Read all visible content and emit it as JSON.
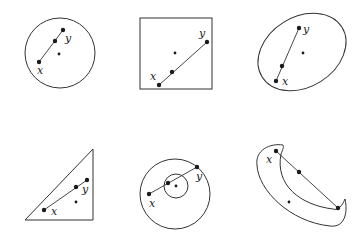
{
  "figure": {
    "panels": [
      {
        "shape": "circle",
        "labels": {
          "x": "x",
          "y": "y"
        },
        "convex": true
      },
      {
        "shape": "square",
        "labels": {
          "x": "x",
          "y": "y"
        },
        "convex": true
      },
      {
        "shape": "ellipse",
        "labels": {
          "x": "x",
          "y": "y"
        },
        "convex": true
      },
      {
        "shape": "triangle",
        "labels": {
          "x": "x",
          "y": "y"
        },
        "convex": true
      },
      {
        "shape": "annulus",
        "labels": {
          "x": "x",
          "y": "y"
        },
        "convex": false
      },
      {
        "shape": "crescent",
        "labels": {
          "x": "x"
        },
        "convex": false
      }
    ],
    "colors": {
      "ink": "#333333",
      "background": "#ffffff"
    }
  }
}
